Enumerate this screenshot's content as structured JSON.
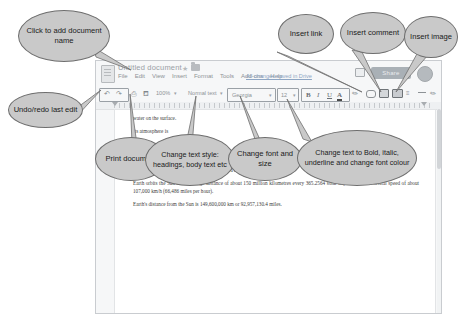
{
  "app": {
    "document_title": "Untitled document",
    "menu_items": [
      "File",
      "Edit",
      "View",
      "Insert",
      "Format",
      "Tools",
      "Add-ons",
      "Help"
    ],
    "saved_status": "All changes saved in Drive",
    "share_label": "Share",
    "toolbar": {
      "undo_icon": "undo-arrow-icon",
      "redo_icon": "redo-arrow-icon",
      "print_icon": "printer-icon",
      "paint_format_icon": "paint-format-icon",
      "zoom_value": "100%",
      "style_value": "Normal text",
      "font_name": "Georgia",
      "font_size": "12",
      "bold_label": "B",
      "italic_label": "I",
      "underline_label": "U",
      "text_color_label": "A",
      "highlight_icon": "highlight-pen-icon",
      "link_icon": "insert-link-icon",
      "comment_icon": "insert-comment-icon",
      "image_icon": "insert-image-icon",
      "align_icon": "align-icon",
      "line_spacing_icon": "line-spacing-icon",
      "pen_icon": "pen-icon",
      "collapse_icon": "collapse-caret-icon"
    },
    "document_text": [
      "water on the surface.",
      "Its atmosphere is",
      "77% nitrogen",
      "21% oxygen",
      "Other gases such as argon, carbon dioxide and a number of others",
      "Earth orbits the Sun at an average distance of about 150 million kilometres every 365.2564 solar days and has an orbital speed of about 107,000 km/h (66,486 miles per hour).",
      "Earth's distance from the Sun is 149,600,000 km or 92,957,130.4 miles."
    ]
  },
  "callouts": [
    {
      "id": "add-document-name",
      "text": "Click to add document name"
    },
    {
      "id": "undo-redo",
      "text": "Undo/redo last edit"
    },
    {
      "id": "print-document",
      "text": "Print document"
    },
    {
      "id": "change-text-style",
      "text": "Change text style: headings, body text etc"
    },
    {
      "id": "change-font",
      "text": "Change font and size"
    },
    {
      "id": "change-text-format",
      "text": "Change text to Bold, italic, underline and change font colour"
    },
    {
      "id": "insert-link",
      "text": "Insert link"
    },
    {
      "id": "insert-comment",
      "text": "Insert comment"
    },
    {
      "id": "insert-image",
      "text": "Insert image"
    }
  ],
  "colors": {
    "callout_fill": "#c9c9c9",
    "callout_border": "#6e6e6e",
    "app_chrome": "#f6f7f8",
    "page_white": "#ffffff"
  }
}
